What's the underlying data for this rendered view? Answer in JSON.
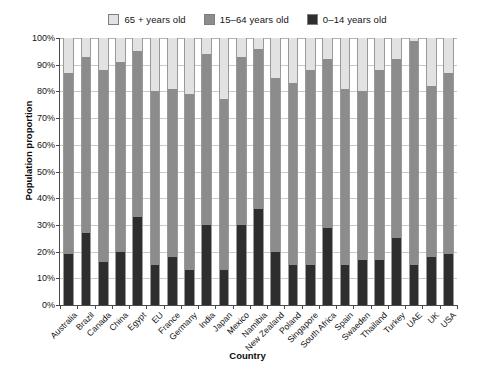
{
  "chart_data": {
    "type": "bar",
    "stacked": true,
    "normalized": true,
    "title": "",
    "xlabel": "Country",
    "ylabel": "Population proportion",
    "ylim": [
      0,
      100
    ],
    "ytick_labels": [
      "0%",
      "10%",
      "20%",
      "30%",
      "40%",
      "50%",
      "60%",
      "70%",
      "80%",
      "90%",
      "100%"
    ],
    "ytick_values": [
      0,
      10,
      20,
      30,
      40,
      50,
      60,
      70,
      80,
      90,
      100
    ],
    "grid": true,
    "legend_position": "top-center",
    "categories": [
      "Australia",
      "Brazil",
      "Canada",
      "China",
      "Egypt",
      "EU",
      "France",
      "Germany",
      "India",
      "Japan",
      "Mexico",
      "Namibia",
      "New Zealand",
      "Poland",
      "Singapore",
      "South Africa",
      "Spain",
      "Swaeden",
      "Thailand",
      "Turkey",
      "UAE",
      "UK",
      "USA"
    ],
    "series": [
      {
        "name": "0–14 years old",
        "color": "#2e2e2e",
        "values": [
          19,
          27,
          16,
          20,
          33,
          15,
          18,
          13,
          30,
          13,
          30,
          36,
          20,
          15,
          15,
          29,
          15,
          17,
          17,
          25,
          15,
          18,
          19
        ]
      },
      {
        "name": "15–64 years old",
        "color": "#8c8c8c",
        "values": [
          68,
          66,
          72,
          71,
          62,
          65,
          63,
          66,
          64,
          64,
          63,
          60,
          65,
          68,
          73,
          63,
          66,
          63,
          71,
          67,
          84,
          64,
          68
        ]
      },
      {
        "name": "65 + years old",
        "color": "#e2e2e2",
        "values": [
          13,
          7,
          12,
          9,
          5,
          20,
          19,
          21,
          6,
          23,
          7,
          4,
          15,
          17,
          12,
          8,
          19,
          20,
          12,
          8,
          1,
          18,
          13
        ]
      }
    ],
    "stack_tops": {
      "young_top": [
        19,
        27,
        16,
        20,
        33,
        15,
        18,
        13,
        30,
        13,
        30,
        36,
        20,
        15,
        15,
        29,
        15,
        17,
        17,
        25,
        15,
        18,
        19
      ],
      "mid_top": [
        87,
        93,
        88,
        91,
        95,
        80,
        81,
        79,
        94,
        77,
        93,
        96,
        85,
        83,
        88,
        92,
        81,
        80,
        88,
        92,
        99,
        82,
        87
      ]
    }
  },
  "legend": {
    "items": [
      {
        "label": "65 + years old",
        "color": "#e2e2e2"
      },
      {
        "label": "15–64 years old",
        "color": "#8c8c8c"
      },
      {
        "label": "0–14 years old",
        "color": "#2e2e2e"
      }
    ]
  },
  "axes": {
    "y_title": "Population proportion",
    "x_title": "Country"
  }
}
